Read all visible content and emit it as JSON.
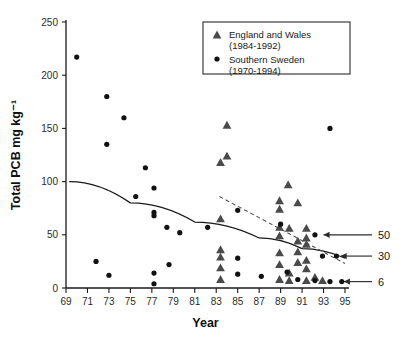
{
  "chart_data": {
    "type": "scatter",
    "title": "",
    "xlabel": "Year",
    "ylabel": "Total PCB mg kg⁻¹",
    "xlim": [
      69,
      95
    ],
    "ylim": [
      0,
      250
    ],
    "xticks": [
      69,
      71,
      73,
      75,
      77,
      79,
      81,
      83,
      85,
      87,
      89,
      91,
      93,
      95
    ],
    "yticks": [
      0,
      50,
      100,
      150,
      200,
      250
    ],
    "grid": false,
    "legend_position": "top-right",
    "series": [
      {
        "name": "England and Wales",
        "period": "(1984-1992)",
        "label": "England and Wales",
        "sublabel": "(1984-1992)",
        "marker": "triangle",
        "color": "#4a4a4a",
        "points": [
          [
            84.0,
            234
          ],
          [
            84.0,
            153
          ],
          [
            83.4,
            118
          ],
          [
            84.0,
            124
          ],
          [
            83.4,
            65
          ],
          [
            89.7,
            97
          ],
          [
            88.9,
            82
          ],
          [
            88.9,
            74
          ],
          [
            90.6,
            80
          ],
          [
            88.9,
            57
          ],
          [
            89.8,
            56
          ],
          [
            91.4,
            56
          ],
          [
            88.9,
            49
          ],
          [
            91.4,
            47
          ],
          [
            91.4,
            41
          ],
          [
            90.6,
            34
          ],
          [
            88.9,
            33
          ],
          [
            83.4,
            36
          ],
          [
            83.4,
            29
          ],
          [
            83.4,
            19
          ],
          [
            83.4,
            8
          ],
          [
            88.9,
            22
          ],
          [
            89.8,
            14
          ],
          [
            91.4,
            26
          ],
          [
            91.4,
            18
          ],
          [
            92.2,
            10
          ],
          [
            89.8,
            7
          ],
          [
            91.4,
            7
          ],
          [
            92.9,
            7
          ],
          [
            88.9,
            8
          ],
          [
            90.6,
            44
          ],
          [
            90.6,
            24
          ]
        ]
      },
      {
        "name": "Southern Sweden",
        "period": "(1970-1994)",
        "label": "Southern Sweden",
        "sublabel": "(1970-1994)",
        "marker": "circle",
        "color": "#111111",
        "points": [
          [
            70.0,
            217
          ],
          [
            72.8,
            180
          ],
          [
            74.4,
            160
          ],
          [
            72.8,
            135
          ],
          [
            76.4,
            113
          ],
          [
            77.2,
            94
          ],
          [
            75.5,
            86
          ],
          [
            77.2,
            71
          ],
          [
            77.2,
            68
          ],
          [
            78.4,
            57
          ],
          [
            79.6,
            52
          ],
          [
            71.8,
            25
          ],
          [
            73.0,
            12
          ],
          [
            77.2,
            14
          ],
          [
            77.2,
            4
          ],
          [
            78.6,
            22
          ],
          [
            82.2,
            57
          ],
          [
            85.0,
            73
          ],
          [
            85.0,
            13
          ],
          [
            84.6,
            231
          ],
          [
            87.2,
            11
          ],
          [
            89.6,
            15
          ],
          [
            92.2,
            50
          ],
          [
            93.6,
            150
          ],
          [
            92.9,
            30
          ],
          [
            94.2,
            30
          ],
          [
            93.6,
            6
          ],
          [
            94.7,
            6
          ],
          [
            92.2,
            7
          ],
          [
            90.6,
            8
          ],
          [
            85.0,
            28
          ],
          [
            89.0,
            60
          ]
        ]
      }
    ],
    "trendlines": [
      {
        "name": "southern-sweden-trend",
        "style": "solid",
        "color": "#1a1a1a",
        "points": [
          [
            69.3,
            100
          ],
          [
            75,
            80
          ],
          [
            81,
            62
          ],
          [
            87,
            47
          ],
          [
            91,
            37
          ],
          [
            95,
            28
          ]
        ]
      },
      {
        "name": "england-wales-trend",
        "style": "dashed",
        "color": "#4f4f4f",
        "points": [
          [
            83.3,
            86
          ],
          [
            95,
            23
          ]
        ]
      }
    ],
    "annotations": [
      {
        "label": "50",
        "value": 50,
        "target_x": 93.0
      },
      {
        "label": "30",
        "value": 30,
        "target_x": 94.6
      },
      {
        "label": "6",
        "value": 6,
        "target_x": 94.9
      }
    ]
  },
  "legend": {
    "entries": [
      {
        "label": "England and Wales",
        "sublabel": "(1984-1992)",
        "marker": "triangle"
      },
      {
        "label": "Southern Sweden",
        "sublabel": "(1970-1994)",
        "marker": "circle"
      }
    ]
  }
}
